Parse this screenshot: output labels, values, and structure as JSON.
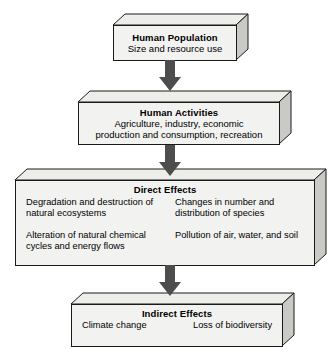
{
  "diagram": {
    "colors": {
      "box_front": "#f2f2f0",
      "box_side": "#c9c9c6",
      "box_top": "#ededea",
      "outline": "#1a1a1a",
      "arrow": "#4d4d4d",
      "background": "#ffffff"
    },
    "boxes": [
      {
        "id": "human-population",
        "title": "Human Population",
        "subtitle": "Size and resource use"
      },
      {
        "id": "human-activities",
        "title": "Human Activities",
        "line1": "Agriculture, industry, economic",
        "line2": "production and consumption, recreation"
      },
      {
        "id": "direct-effects",
        "title": "Direct Effects",
        "left_column": [
          "Degradation and destruction of natural ecosystems",
          "Alteration of natural chemical cycles and energy flows"
        ],
        "right_column": [
          "Changes in number and distribution of species",
          "Pollution of air, water, and soil"
        ]
      },
      {
        "id": "indirect-effects",
        "title": "Indirect Effects",
        "left_column": [
          "Climate change"
        ],
        "right_column": [
          "Loss of biodiversity"
        ]
      }
    ],
    "arrows": [
      {
        "id": "arrow-population-to-activities",
        "direction": "down"
      },
      {
        "id": "arrow-activities-to-direct",
        "direction": "down"
      },
      {
        "id": "arrow-direct-to-indirect",
        "direction": "down"
      }
    ]
  }
}
